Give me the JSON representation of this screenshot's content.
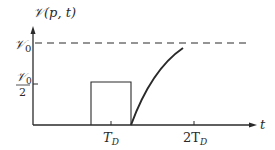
{
  "diagram": {
    "y_axis_label": "𝒱(p, t)",
    "x_axis_label": "t",
    "y_ticks": [
      {
        "label_num": "𝒱",
        "label_sub": "0",
        "label_den": "2",
        "kind": "fraction"
      },
      {
        "label": "𝒱",
        "label_sub": "0",
        "kind": "level"
      }
    ],
    "x_ticks": [
      {
        "label": "T",
        "sub": "D"
      },
      {
        "label": "2T",
        "sub": "D"
      }
    ],
    "series": [
      {
        "name": "pulse",
        "shape": "rectangle",
        "height": "𝒱0/2",
        "from": "before T_D",
        "to": "after T_D"
      },
      {
        "name": "charging-curve",
        "shape": "exponential-rise",
        "approaches": "𝒱0"
      },
      {
        "name": "asymptote",
        "shape": "dashed-horizontal",
        "level": "𝒱0"
      }
    ],
    "colors": {
      "line": "#2a2a2a"
    }
  }
}
